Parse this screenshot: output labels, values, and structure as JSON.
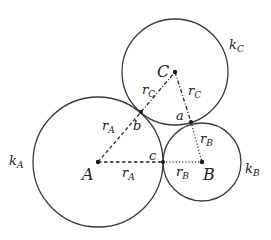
{
  "diagram": {
    "circles": [
      {
        "id": "kA",
        "center": "A",
        "cx": 98,
        "cy": 162,
        "r": 65,
        "label": "k",
        "label_sub": "A"
      },
      {
        "id": "kB",
        "center": "B",
        "cx": 202,
        "cy": 162,
        "r": 39,
        "label": "k",
        "label_sub": "B"
      },
      {
        "id": "kC",
        "center": "C",
        "cx": 175,
        "cy": 72,
        "r": 53,
        "label": "k",
        "label_sub": "C"
      }
    ],
    "centers": {
      "A": {
        "label": "A"
      },
      "B": {
        "label": "B"
      },
      "C": {
        "label": "C"
      }
    },
    "tangent_points": {
      "a": {
        "label": "a"
      },
      "b": {
        "label": "b"
      },
      "c": {
        "label": "c"
      }
    },
    "radius_labels": {
      "rA_horizontal": {
        "main": "r",
        "sub": "A"
      },
      "rA_diagonal": {
        "main": "r",
        "sub": "A"
      },
      "rB_horizontal": {
        "main": "r",
        "sub": "B"
      },
      "rB_diagonal": {
        "main": "r",
        "sub": "B"
      },
      "rC_left": {
        "main": "r",
        "sub": "C"
      },
      "rC_right": {
        "main": "r",
        "sub": "C"
      }
    }
  }
}
